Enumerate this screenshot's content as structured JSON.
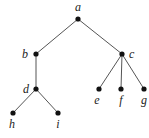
{
  "diagram": {
    "type": "tree",
    "nodes": [
      {
        "id": "a",
        "label": "a",
        "x": 78,
        "y": 19,
        "lx": 78,
        "ly": 11,
        "anchor": "middle"
      },
      {
        "id": "b",
        "label": "b",
        "x": 36,
        "y": 54,
        "lx": 28,
        "ly": 58,
        "anchor": "end"
      },
      {
        "id": "c",
        "label": "c",
        "x": 122,
        "y": 54,
        "lx": 129,
        "ly": 58,
        "anchor": "start"
      },
      {
        "id": "d",
        "label": "d",
        "x": 36,
        "y": 89,
        "lx": 29,
        "ly": 93,
        "anchor": "end"
      },
      {
        "id": "e",
        "label": "e",
        "x": 99,
        "y": 89,
        "lx": 97,
        "ly": 104,
        "anchor": "middle"
      },
      {
        "id": "f",
        "label": "f",
        "x": 121,
        "y": 89,
        "lx": 121,
        "ly": 104,
        "anchor": "middle"
      },
      {
        "id": "g",
        "label": "g",
        "x": 144,
        "y": 89,
        "lx": 144,
        "ly": 104,
        "anchor": "middle"
      },
      {
        "id": "h",
        "label": "h",
        "x": 13,
        "y": 113,
        "lx": 12,
        "ly": 128,
        "anchor": "middle"
      },
      {
        "id": "i",
        "label": "i",
        "x": 58,
        "y": 113,
        "lx": 58,
        "ly": 128,
        "anchor": "middle"
      }
    ],
    "edges": [
      [
        "a",
        "b"
      ],
      [
        "a",
        "c"
      ],
      [
        "b",
        "d"
      ],
      [
        "d",
        "h"
      ],
      [
        "d",
        "i"
      ],
      [
        "c",
        "e"
      ],
      [
        "c",
        "f"
      ],
      [
        "c",
        "g"
      ]
    ],
    "colors": {
      "edge": "#555555",
      "node": "#111111",
      "label": "#222222"
    }
  }
}
